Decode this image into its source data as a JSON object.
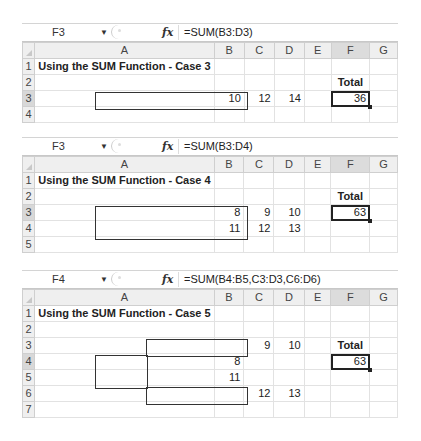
{
  "columns": [
    "A",
    "B",
    "C",
    "D",
    "E",
    "F",
    "G"
  ],
  "blocks": [
    {
      "name_box": "F3",
      "fx_label": "fx",
      "formula": "=SUM(B3:D3)",
      "active_cell": "F3",
      "rows": [
        "1",
        "2",
        "3",
        "4"
      ],
      "title": "Using the SUM Function - Case 3",
      "total_label": "Total",
      "cells": {
        "B3": "10",
        "C3": "12",
        "D3": "14",
        "F3": "36"
      }
    },
    {
      "name_box": "F3",
      "fx_label": "fx",
      "formula": "=SUM(B3:D4)",
      "active_cell": "F3",
      "rows": [
        "1",
        "2",
        "3",
        "4",
        "5"
      ],
      "title": "Using the SUM Function - Case 4",
      "total_label": "Total",
      "cells": {
        "B3": "8",
        "C3": "9",
        "D3": "10",
        "B4": "11",
        "C4": "12",
        "D4": "13",
        "F3": "63"
      }
    },
    {
      "name_box": "F4",
      "fx_label": "fx",
      "formula": "=SUM(B4:B5,C3:D3,C6:D6)",
      "active_cell": "F4",
      "rows": [
        "1",
        "2",
        "3",
        "4",
        "5",
        "6",
        "7"
      ],
      "title": "Using the SUM Function - Case 5",
      "total_label": "Total",
      "cells": {
        "C3": "9",
        "D3": "10",
        "B4": "8",
        "B5": "11",
        "C6": "12",
        "D6": "13",
        "F4": "63"
      }
    }
  ]
}
